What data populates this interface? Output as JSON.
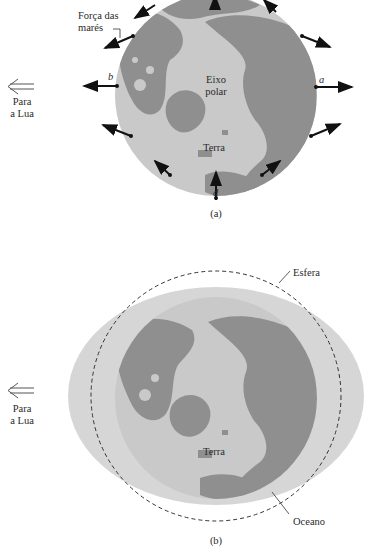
{
  "panel_a": {
    "caption": "(a)",
    "tidal_force_label_line1": "Força das",
    "tidal_force_label_line2": "marés",
    "polar_axis_line1": "Eixo",
    "polar_axis_line2": "polar",
    "earth_label": "Terra",
    "point_a": "a",
    "point_b": "b",
    "point_d": "d",
    "moon_direction_line1": "Para",
    "moon_direction_line2": "a Lua"
  },
  "panel_b": {
    "caption": "(b)",
    "sphere_label": "Esfera",
    "ocean_label": "Oceano",
    "earth_label": "Terra",
    "moon_direction_line1": "Para",
    "moon_direction_line2": "a Lua"
  },
  "colors": {
    "land": "#8f8f8f",
    "ice_sea": "#c9c9c9",
    "ocean_bulge": "#d6d6d6",
    "arrow": "#111111",
    "dashed_sphere": "#333333"
  }
}
